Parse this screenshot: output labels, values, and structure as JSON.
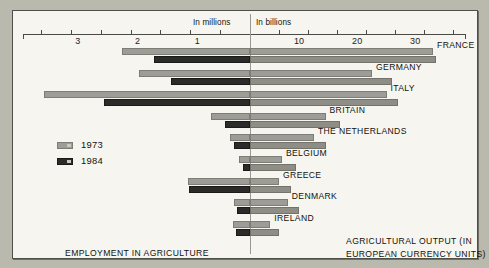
{
  "chart_data": {
    "type": "bar",
    "title": "",
    "orientation": "horizontal-diverging",
    "axis_units": {
      "left": "In millions",
      "right": "In billions"
    },
    "left_caption": "EMPLOYMENT IN AGRICULTURE",
    "right_caption_line1": "AGRICULTURAL OUTPUT (IN",
    "right_caption_line2": "EUROPEAN CURRENCY UNITS)",
    "legend": [
      {
        "label": "1973",
        "color": "#9d9d97"
      },
      {
        "label": "1984",
        "color": "#2b2b29"
      }
    ],
    "left_axis": {
      "label": "In millions",
      "ticks": [
        3,
        2,
        1
      ],
      "minor_ticks": [
        3.5,
        2.5,
        1.5,
        0.5
      ],
      "direction": "right-to-left-increasing",
      "max": 3.8
    },
    "right_axis": {
      "label": "In billions",
      "ticks": [
        10,
        20,
        30
      ],
      "minor_ticks": [
        5,
        15,
        25,
        35
      ],
      "direction": "left-to-right-increasing",
      "max": 37
    },
    "categories": [
      "FRANCE",
      "GERMANY",
      "ITALY",
      "BRITAIN",
      "THE NETHERLANDS",
      "BELGIUM",
      "GREECE",
      "DENMARK",
      "IRELAND"
    ],
    "series": [
      {
        "name": "1973",
        "employment_millions": [
          2.15,
          1.85,
          3.45,
          0.66,
          0.33,
          0.18,
          1.03,
          0.26,
          0.29
        ],
        "output_billions": [
          31.5,
          21.0,
          23.5,
          13.0,
          11.0,
          5.5,
          5.0,
          6.5,
          3.5
        ]
      },
      {
        "name": "1984",
        "employment_millions": [
          1.6,
          1.32,
          2.45,
          0.42,
          0.26,
          0.12,
          1.02,
          0.21,
          0.23
        ],
        "output_billions": [
          32.0,
          24.5,
          25.5,
          15.5,
          13.0,
          8.0,
          7.0,
          8.5,
          5.0
        ]
      }
    ],
    "grid": false,
    "legend_position": "left-middle"
  },
  "colors": {
    "paper": "#f7f5ef",
    "frame": "#4e4e4a",
    "light_gray": "#9d9d97",
    "dark_gray": "#2b2b29",
    "mid_gray": "#8e8e87",
    "background": "#b9b9ad"
  }
}
